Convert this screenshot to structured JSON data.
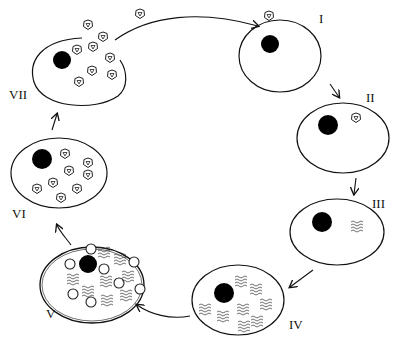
{
  "diagram": {
    "type": "viral replication cycle",
    "stages": [
      {
        "id": "I",
        "label": "I",
        "description": "Virion attaches to cell"
      },
      {
        "id": "II",
        "label": "II",
        "description": "Virion inside cell"
      },
      {
        "id": "III",
        "label": "III",
        "description": "Uncoating; viral nucleic acid released"
      },
      {
        "id": "IV",
        "label": "IV",
        "description": "Replication of viral nucleic acid"
      },
      {
        "id": "V",
        "label": "V",
        "description": "Synthesis of capsid proteins and nucleic acid"
      },
      {
        "id": "VI",
        "label": "VI",
        "description": "Assembly of new virions"
      },
      {
        "id": "VII",
        "label": "VII",
        "description": "Release of virions from cell"
      }
    ],
    "colors": {
      "line": "#111111",
      "nucleus": "#000000",
      "background": "#ffffff"
    }
  }
}
